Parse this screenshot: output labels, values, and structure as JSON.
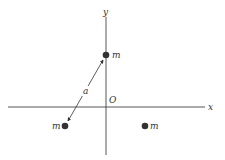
{
  "diagram": {
    "axes": {
      "x_label": "x",
      "y_label": "y",
      "origin_label": "O"
    },
    "masses": [
      {
        "id": "top",
        "label": "m",
        "position": "on positive y-axis"
      },
      {
        "id": "bottom-left",
        "label": "m",
        "position": "below x-axis, left of y-axis"
      },
      {
        "id": "bottom-right",
        "label": "m",
        "position": "below x-axis, right of y-axis"
      }
    ],
    "dimension": {
      "label": "a",
      "between": [
        "bottom-left",
        "top"
      ]
    },
    "colors": {
      "ink": "#333333",
      "background": "#ffffff"
    }
  }
}
